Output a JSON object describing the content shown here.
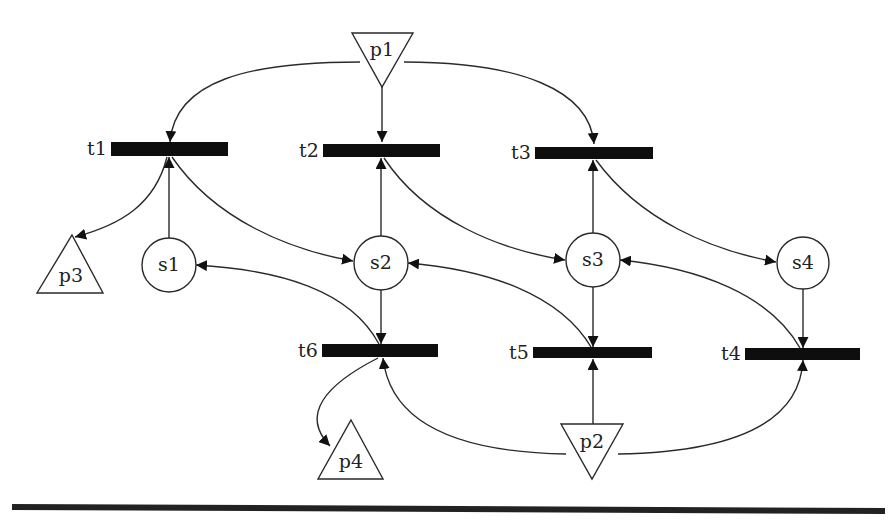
{
  "diagram": {
    "type": "petri-net",
    "places": [
      {
        "id": "s1",
        "label": "s1",
        "shape": "circle"
      },
      {
        "id": "s2",
        "label": "s2",
        "shape": "circle"
      },
      {
        "id": "s3",
        "label": "s3",
        "shape": "circle"
      },
      {
        "id": "s4",
        "label": "s4",
        "shape": "circle"
      },
      {
        "id": "p1",
        "label": "p1",
        "shape": "triangle-down"
      },
      {
        "id": "p2",
        "label": "p2",
        "shape": "triangle-down"
      },
      {
        "id": "p3",
        "label": "p3",
        "shape": "triangle-up"
      },
      {
        "id": "p4",
        "label": "p4",
        "shape": "triangle-up"
      }
    ],
    "transitions": [
      {
        "id": "t1",
        "label": "t1"
      },
      {
        "id": "t2",
        "label": "t2"
      },
      {
        "id": "t3",
        "label": "t3"
      },
      {
        "id": "t4",
        "label": "t4"
      },
      {
        "id": "t5",
        "label": "t5"
      },
      {
        "id": "t6",
        "label": "t6"
      }
    ],
    "arcs": [
      {
        "from": "p1",
        "to": "t1"
      },
      {
        "from": "p1",
        "to": "t2"
      },
      {
        "from": "p1",
        "to": "t3"
      },
      {
        "from": "s1",
        "to": "t1"
      },
      {
        "from": "t1",
        "to": "p3"
      },
      {
        "from": "t1",
        "to": "s2"
      },
      {
        "from": "s2",
        "to": "t2"
      },
      {
        "from": "t2",
        "to": "s3"
      },
      {
        "from": "s3",
        "to": "t3"
      },
      {
        "from": "t3",
        "to": "s4"
      },
      {
        "from": "s2",
        "to": "t6"
      },
      {
        "from": "t6",
        "to": "s1"
      },
      {
        "from": "t6",
        "to": "p4"
      },
      {
        "from": "s3",
        "to": "t5"
      },
      {
        "from": "t5",
        "to": "s2"
      },
      {
        "from": "s4",
        "to": "t4"
      },
      {
        "from": "t4",
        "to": "s3"
      },
      {
        "from": "p2",
        "to": "t5"
      },
      {
        "from": "p2",
        "to": "t6"
      },
      {
        "from": "p2",
        "to": "t4"
      }
    ]
  },
  "labels": {
    "p1": "p1",
    "p2": "p2",
    "p3": "p3",
    "p4": "p4",
    "s1": "s1",
    "s2": "s2",
    "s3": "s3",
    "s4": "s4",
    "t1": "t1",
    "t2": "t2",
    "t3": "t3",
    "t4": "t4",
    "t5": "t5",
    "t6": "t6"
  },
  "colors": {
    "stroke": "#2a2a2a",
    "transition_fill": "#0e0e0e",
    "background": "#ffffff"
  }
}
